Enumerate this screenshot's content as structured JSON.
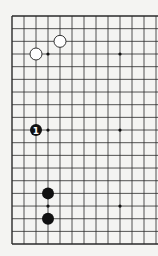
{
  "board": {
    "size": 19,
    "visible_columns": 13,
    "visible_rows": 19,
    "origin_x": 12,
    "origin_y": 16,
    "spacing_x": 12,
    "spacing_y": 12.67,
    "line_color": "#2a2a2a",
    "background": "#f4f4f2",
    "star_points": [
      {
        "col": 3,
        "row": 3
      },
      {
        "col": 9,
        "row": 3
      },
      {
        "col": 3,
        "row": 9
      },
      {
        "col": 9,
        "row": 9
      },
      {
        "col": 3,
        "row": 15
      },
      {
        "col": 9,
        "row": 15
      }
    ],
    "stones": [
      {
        "color": "white",
        "col": 2,
        "row": 3,
        "label": ""
      },
      {
        "color": "white",
        "col": 4,
        "row": 2,
        "label": ""
      },
      {
        "color": "black",
        "col": 2,
        "row": 9,
        "label": "1"
      },
      {
        "color": "black",
        "col": 3,
        "row": 14,
        "label": ""
      },
      {
        "color": "black",
        "col": 3,
        "row": 16,
        "label": ""
      }
    ]
  }
}
